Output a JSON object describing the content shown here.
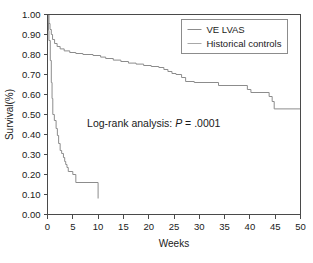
{
  "chart_data": {
    "type": "line",
    "subtype": "kaplan-meier-step",
    "title": "",
    "xlabel": "Weeks",
    "ylabel": "Survival(%)",
    "xlim": [
      0,
      50
    ],
    "ylim": [
      0.0,
      1.0
    ],
    "xticks": [
      0,
      5,
      10,
      15,
      20,
      25,
      30,
      35,
      40,
      45,
      50
    ],
    "xtick_labels": [
      "0",
      "5",
      "10",
      "15",
      "20",
      "25",
      "30",
      "35",
      "40",
      "45",
      "50"
    ],
    "yticks": [
      0.0,
      0.1,
      0.2,
      0.3,
      0.4,
      0.5,
      0.6,
      0.7,
      0.8,
      0.9,
      1.0
    ],
    "ytick_labels": [
      "0.00",
      "0.10",
      "0.20",
      "0.30",
      "0.40",
      "0.50",
      "0.60",
      "0.70",
      "0.80",
      "0.90",
      "1.00"
    ],
    "grid": false,
    "legend_position": "top-right",
    "annotations": [
      {
        "name": "log-rank-annotation",
        "prefix": "Log-rank analysis: ",
        "italic": "P",
        "suffix": " = .0001",
        "x": 21.0,
        "y": 0.44
      }
    ],
    "series": [
      {
        "name": "VE LVAS",
        "color": "#8c8c8c",
        "points": [
          [
            0.0,
            1.0
          ],
          [
            0.15,
            1.0
          ],
          [
            0.15,
            0.96
          ],
          [
            0.2,
            0.96
          ],
          [
            0.2,
            0.92
          ],
          [
            0.28,
            0.92
          ],
          [
            0.28,
            0.87
          ],
          [
            0.55,
            0.87
          ],
          [
            0.55,
            0.77
          ],
          [
            0.75,
            0.77
          ],
          [
            0.75,
            0.66
          ],
          [
            0.9,
            0.66
          ],
          [
            0.9,
            0.58
          ],
          [
            1.05,
            0.58
          ],
          [
            1.05,
            0.5
          ],
          [
            1.35,
            0.5
          ],
          [
            1.35,
            0.47
          ],
          [
            1.7,
            0.47
          ],
          [
            1.7,
            0.43
          ],
          [
            1.95,
            0.43
          ],
          [
            1.95,
            0.395
          ],
          [
            2.2,
            0.395
          ],
          [
            2.2,
            0.355
          ],
          [
            2.5,
            0.355
          ],
          [
            2.5,
            0.32
          ],
          [
            2.8,
            0.32
          ],
          [
            2.8,
            0.305
          ],
          [
            3.15,
            0.305
          ],
          [
            3.15,
            0.285
          ],
          [
            3.4,
            0.285
          ],
          [
            3.4,
            0.265
          ],
          [
            3.6,
            0.265
          ],
          [
            3.6,
            0.25
          ],
          [
            3.85,
            0.25
          ],
          [
            3.85,
            0.235
          ],
          [
            4.1,
            0.235
          ],
          [
            4.1,
            0.215
          ],
          [
            5.0,
            0.215
          ],
          [
            5.0,
            0.2
          ],
          [
            5.6,
            0.2
          ],
          [
            5.6,
            0.16
          ],
          [
            10.0,
            0.16
          ],
          [
            10.0,
            0.08
          ]
        ]
      },
      {
        "name": "Historical controls",
        "color": "#8c8c8c",
        "points": [
          [
            0.0,
            1.0
          ],
          [
            0.3,
            1.0
          ],
          [
            0.3,
            0.955
          ],
          [
            0.5,
            0.955
          ],
          [
            0.5,
            0.925
          ],
          [
            0.75,
            0.925
          ],
          [
            0.75,
            0.9
          ],
          [
            1.0,
            0.9
          ],
          [
            1.0,
            0.875
          ],
          [
            1.4,
            0.875
          ],
          [
            1.4,
            0.855
          ],
          [
            1.9,
            0.855
          ],
          [
            1.9,
            0.84
          ],
          [
            2.5,
            0.84
          ],
          [
            2.5,
            0.828
          ],
          [
            3.3,
            0.828
          ],
          [
            3.3,
            0.818
          ],
          [
            4.4,
            0.818
          ],
          [
            4.4,
            0.81
          ],
          [
            5.6,
            0.81
          ],
          [
            5.6,
            0.805
          ],
          [
            7.0,
            0.805
          ],
          [
            7.0,
            0.8
          ],
          [
            9.0,
            0.8
          ],
          [
            9.0,
            0.795
          ],
          [
            10.5,
            0.795
          ],
          [
            10.5,
            0.787
          ],
          [
            11.5,
            0.787
          ],
          [
            11.5,
            0.78
          ],
          [
            13.0,
            0.78
          ],
          [
            13.0,
            0.772
          ],
          [
            14.5,
            0.772
          ],
          [
            14.5,
            0.765
          ],
          [
            16.0,
            0.765
          ],
          [
            16.0,
            0.757
          ],
          [
            17.5,
            0.757
          ],
          [
            17.5,
            0.752
          ],
          [
            19.0,
            0.752
          ],
          [
            19.0,
            0.745
          ],
          [
            20.5,
            0.745
          ],
          [
            20.5,
            0.74
          ],
          [
            22.0,
            0.74
          ],
          [
            22.0,
            0.735
          ],
          [
            23.0,
            0.735
          ],
          [
            23.0,
            0.725
          ],
          [
            23.8,
            0.725
          ],
          [
            23.8,
            0.715
          ],
          [
            24.6,
            0.715
          ],
          [
            24.6,
            0.705
          ],
          [
            25.4,
            0.705
          ],
          [
            25.4,
            0.7
          ],
          [
            26.5,
            0.7
          ],
          [
            26.5,
            0.685
          ],
          [
            27.3,
            0.685
          ],
          [
            27.3,
            0.665
          ],
          [
            29.0,
            0.665
          ],
          [
            29.0,
            0.66
          ],
          [
            33.8,
            0.66
          ],
          [
            33.8,
            0.645
          ],
          [
            39.5,
            0.645
          ],
          [
            39.5,
            0.625
          ],
          [
            40.2,
            0.625
          ],
          [
            40.2,
            0.61
          ],
          [
            43.8,
            0.61
          ],
          [
            43.8,
            0.59
          ],
          [
            44.4,
            0.59
          ],
          [
            44.4,
            0.565
          ],
          [
            44.8,
            0.565
          ],
          [
            44.8,
            0.528
          ],
          [
            50.0,
            0.528
          ]
        ]
      }
    ],
    "legend": [
      {
        "label": "VE LVAS",
        "color": "#8c8c8c"
      },
      {
        "label": "Historical controls",
        "color": "#a8a8a8"
      }
    ]
  }
}
